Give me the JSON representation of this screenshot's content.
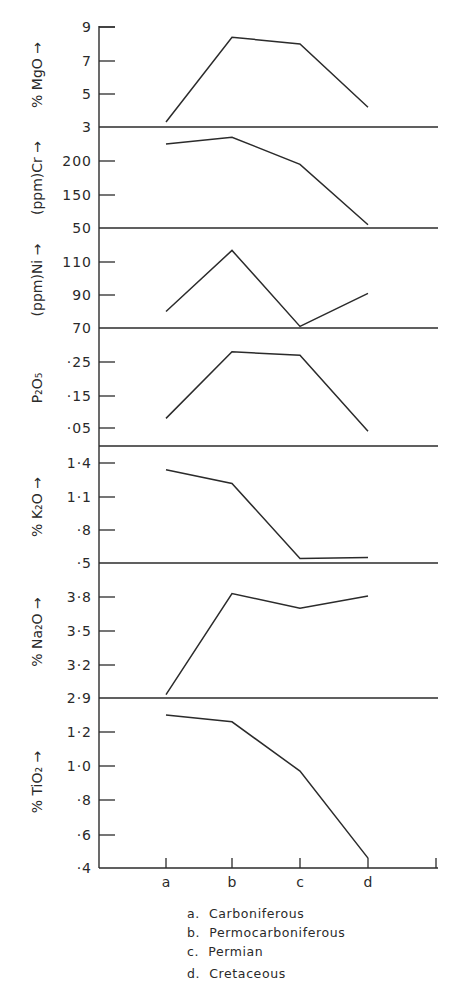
{
  "chart_data": {
    "type": "line",
    "layout": "stacked-panels-shared-x",
    "categories": [
      "a",
      "b",
      "c",
      "d"
    ],
    "legend": [
      {
        "key": "a",
        "label": "Carboniferous"
      },
      {
        "key": "b",
        "label": "Permocarboniferous"
      },
      {
        "key": "c",
        "label": "Permian"
      },
      {
        "key": "d",
        "label": "Cretaceous"
      }
    ],
    "grid": false,
    "panels": [
      {
        "ylabel": "% MgO →",
        "ticks": [
          "9",
          "7",
          "5",
          "3"
        ],
        "tick_values": [
          9,
          7,
          5,
          3
        ],
        "ylim": [
          3,
          9
        ],
        "values": [
          3.3,
          8.4,
          8.0,
          4.2
        ]
      },
      {
        "ylabel": "(ppm)Cr →",
        "ticks": [
          "200",
          "150",
          "50"
        ],
        "tick_values": [
          200,
          150,
          50
        ],
        "ylim": [
          50,
          250
        ],
        "values": [
          225,
          235,
          195,
          60
        ]
      },
      {
        "ylabel": "(ppm)Ni →",
        "ticks": [
          "110",
          "90",
          "70"
        ],
        "tick_values": [
          110,
          90,
          70
        ],
        "ylim": [
          70,
          130
        ],
        "values": [
          80,
          117,
          71,
          91
        ]
      },
      {
        "ylabel": "P₂O₅",
        "ticks": [
          "·25",
          "·15",
          "·05"
        ],
        "tick_values": [
          0.25,
          0.15,
          0.05
        ],
        "ylim": [
          0.0,
          0.33
        ],
        "values": [
          0.08,
          0.28,
          0.27,
          0.04
        ]
      },
      {
        "ylabel": "% K₂O →",
        "ticks": [
          "1·4",
          "1·1",
          "·8",
          "·5"
        ],
        "tick_values": [
          1.4,
          1.1,
          0.8,
          0.5
        ],
        "ylim": [
          0.5,
          1.5
        ],
        "values": [
          1.34,
          1.22,
          0.54,
          0.55
        ]
      },
      {
        "ylabel": "% Na₂O →",
        "ticks": [
          "3·8",
          "3·5",
          "3·2",
          "2·9"
        ],
        "tick_values": [
          3.8,
          3.5,
          3.2,
          2.9
        ],
        "ylim": [
          2.9,
          4.0
        ],
        "values": [
          2.93,
          3.83,
          3.7,
          3.81
        ]
      },
      {
        "ylabel": "% TiO₂ →",
        "ticks": [
          "1·2",
          "1·0",
          "·8",
          "·6",
          "·4"
        ],
        "tick_values": [
          1.2,
          1.0,
          0.8,
          0.6,
          0.4
        ],
        "ylim": [
          0.4,
          1.4
        ],
        "values": [
          1.3,
          1.26,
          0.97,
          0.46
        ]
      }
    ],
    "xlabel": "",
    "title": ""
  }
}
